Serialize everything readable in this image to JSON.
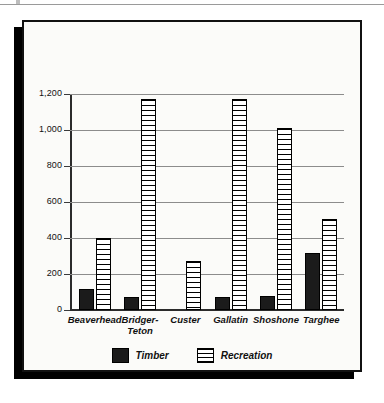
{
  "chart_data": {
    "type": "bar",
    "title": "",
    "subtitle": "",
    "xlabel": "",
    "ylabel": "",
    "ylim": [
      0,
      1200
    ],
    "yticks": [
      0,
      200,
      400,
      600,
      800,
      1000,
      1200
    ],
    "ytick_labels": [
      "0",
      "200",
      "400",
      "600",
      "800",
      "1,000",
      "1,200"
    ],
    "grid": true,
    "legend_position": "bottom-center",
    "categories": [
      "Beaverhead",
      "Bridger-\nTeton",
      "Custer",
      "Gallatin",
      "Shoshone",
      "Targhee"
    ],
    "series": [
      {
        "name": "Timber",
        "fill": "solid-black",
        "color": "#1b1b1b",
        "values": [
          115,
          70,
          0,
          75,
          78,
          315
        ]
      },
      {
        "name": "Recreation",
        "fill": "horizontal-hatch",
        "color": "#ffffff",
        "values": [
          400,
          1175,
          270,
          1175,
          1010,
          505
        ]
      }
    ]
  },
  "legend": {
    "items": [
      {
        "label": "Timber",
        "swatch": "solid-black-swatch"
      },
      {
        "label": "Recreation",
        "swatch": "hatched-swatch"
      }
    ]
  },
  "colors": {
    "frame": "#111111",
    "shadow": "#000000",
    "paper": "#fbfbf9",
    "gridline": "#8c8c8c",
    "axis": "#2b2b2b",
    "timber": "#1b1b1b",
    "recreation_outline": "#000000"
  }
}
